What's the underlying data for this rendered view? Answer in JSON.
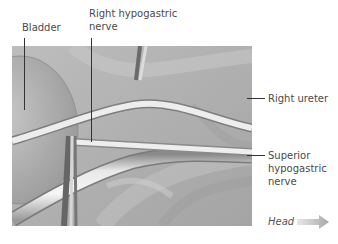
{
  "figure": {
    "type": "anatomical illustration",
    "labels": {
      "bladder": "Bladder",
      "right_hypogastric_line1": "Right hypogastric",
      "right_hypogastric_line2": "nerve",
      "right_ureter": "Right ureter",
      "superior_line1": "Superior",
      "superior_line2": "hypogastric",
      "superior_line3": "nerve",
      "orientation": "Head"
    },
    "orientation_icon": "arrow-right-icon",
    "colors": {
      "background": "#ffffff",
      "tissue_dark": "#9c9c9c",
      "tissue_mid": "#b8b8b8",
      "tissue_light": "#d2d2d2",
      "nerve_white": "#f2f2f2",
      "leader_line": "#333333",
      "arrow": "#b4b4b4"
    }
  }
}
